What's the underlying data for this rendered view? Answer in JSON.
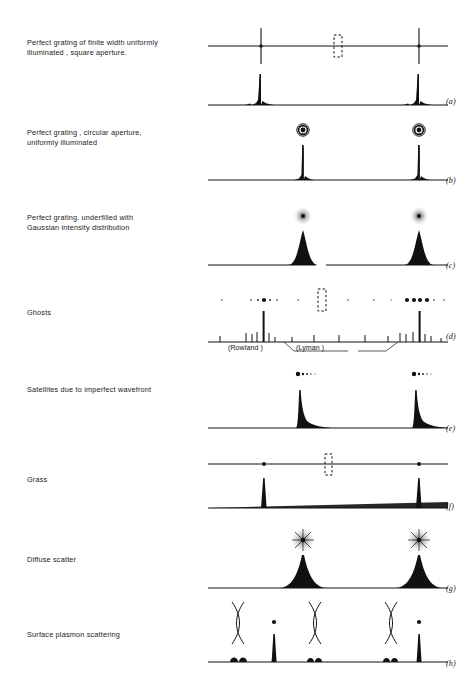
{
  "figure": {
    "background_color": "#ffffff",
    "ink_color": "#111111",
    "width": 474,
    "height": 683
  },
  "rows": [
    {
      "id": "a",
      "label": "Perfect grating of finite width uniformly\nilluminated , square aperture.",
      "panel_letter": "(a)",
      "spot_pattern": "cross-shaped-orders",
      "profile": "two-sharp-peaks-with-small-sidelobes",
      "has_dashed_box": true
    },
    {
      "id": "b",
      "label": "Perfect grating , circular aperture,\nuniformly illuminated",
      "panel_letter": "(b)",
      "spot_pattern": "airy-ring-discs",
      "profile": "two-sharp-peaks-narrow-base",
      "has_dashed_box": false
    },
    {
      "id": "c",
      "label": "Perfect grating. underfilled with\nGaussian intensity distribution",
      "panel_letter": "(c)",
      "spot_pattern": "soft-gaussian-spots",
      "profile": "two-broad-gaussian-peaks",
      "has_dashed_box": false
    },
    {
      "id": "d",
      "label": "Ghosts",
      "panel_letter": "(d)",
      "spot_pattern": "order-with-ghost-satellites",
      "profile": "main-peaks-with-ghost-lines",
      "has_dashed_box": true,
      "annotations": [
        {
          "text": "(Rowland )",
          "kind": "ghost-family"
        },
        {
          "text": "(Lyman )",
          "kind": "ghost-family"
        }
      ]
    },
    {
      "id": "e",
      "label": "Satellites due to imperfect  wavefront",
      "panel_letter": "(e)",
      "spot_pattern": "spot-with-one-sided-satellites",
      "profile": "peaks-with-asymmetric-skirt",
      "has_dashed_box": false
    },
    {
      "id": "f",
      "label": "Grass",
      "panel_letter": "(f)",
      "spot_pattern": "bare-points-on-line",
      "profile": "sharp-peaks-on-raised-grass-floor",
      "has_dashed_box": true
    },
    {
      "id": "g",
      "label": "Diffuse scatter",
      "panel_letter": "(g)",
      "spot_pattern": "starburst-halo-spots",
      "profile": "peaks-with-broad-scatter-wings",
      "has_dashed_box": false
    },
    {
      "id": "h",
      "label": "Surface plasmon scattering",
      "panel_letter": "(h)",
      "spot_pattern": "dots-with-lens-shaped-plasmon-arcs",
      "profile": "sharp-peaks-with-paired-bumps",
      "has_dashed_box": false
    }
  ]
}
